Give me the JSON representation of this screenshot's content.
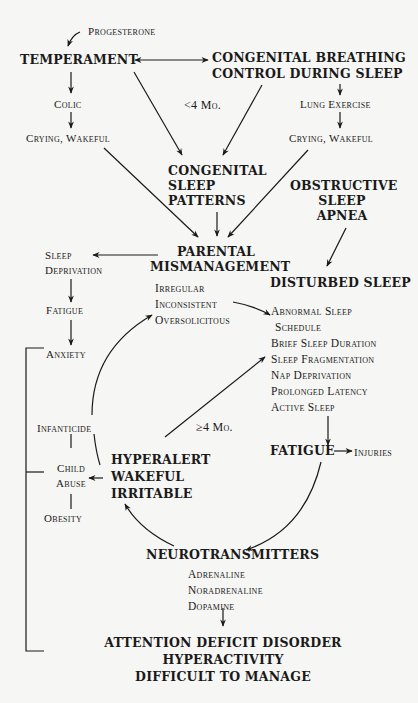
{
  "diagram": {
    "nodes": {
      "progesterone": "Progesterone",
      "temperament": "TEMPERAMENT",
      "congenital_breathing": [
        "CONGENITAL BREATHING",
        "CONTROL DURING SLEEP"
      ],
      "colic": "Colic",
      "crying_left": "Crying, Wakeful",
      "lt4mo": "<4 Mo.",
      "lung_exercise": "Lung Exercise",
      "crying_right": "Crying, Wakeful",
      "congenital_sleep": [
        "CONGENITAL",
        "SLEEP",
        "PATTERNS"
      ],
      "obstructive": [
        "OBSTRUCTIVE",
        "SLEEP",
        "APNEA"
      ],
      "sleep_deprivation": [
        "Sleep",
        "Deprivation"
      ],
      "parental": [
        "PARENTAL",
        "MISMANAGEMENT"
      ],
      "parental_items": [
        "Irregular",
        "Inconsistent",
        "Oversolicitous"
      ],
      "disturbed_sleep": "DISTURBED SLEEP",
      "disturbed_items": [
        "Abnormal Sleep",
        " Schedule",
        "Brief Sleep Duration",
        "Sleep Fragmentation",
        "Nap Deprivation",
        "Prolonged Latency",
        "Active Sleep"
      ],
      "fatigue_left": "Fatigue",
      "anxiety": "Anxiety",
      "ge4mo": "≥4 Mo.",
      "infanticide": "Infanticide",
      "child_abuse": [
        "Child",
        "Abuse"
      ],
      "obesity": "Obesity",
      "hyperalert": [
        "HYPERALERT",
        "WAKEFUL",
        "IRRITABLE"
      ],
      "fatigue_right": "FATIGUE",
      "injuries": "Injuries",
      "neurotransmitters": "NEUROTRANSMITTERS",
      "neuro_items": [
        "Adrenaline",
        "Noradrenaline",
        "Dopamine"
      ],
      "outcome": [
        "ATTENTION DEFICIT DISORDER",
        "HYPERACTIVITY",
        "DIFFICULT TO MANAGE"
      ]
    },
    "colors": {
      "ink": "#1a1a1a",
      "paper": "#f6f6f4"
    }
  }
}
